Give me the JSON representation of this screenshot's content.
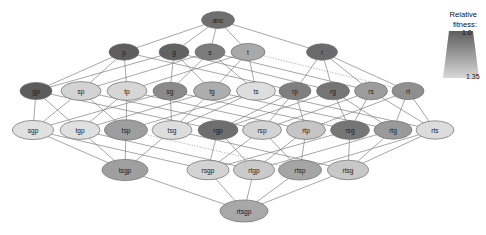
{
  "figure": {
    "type": "network-diagram"
  },
  "legend": {
    "title_line1": "Relative",
    "title_line2": "fitness:",
    "top_tick": "1.0",
    "bottom_tick": "1.35",
    "gradient_top_color": "#5d5d5d",
    "gradient_bottom_color": "#d8d8d8"
  },
  "chart_data": {
    "type": "graph",
    "title": "",
    "levels": [
      1,
      5,
      10,
      10,
      5,
      1
    ],
    "colorscale": {
      "label": "Relative fitness",
      "min": 1.0,
      "max": 1.35,
      "min_color": "#5d5d5d",
      "max_color": "#e2e2e2"
    },
    "nodes": [
      {
        "id": "anc",
        "label": "anc",
        "x": 218,
        "y": 20,
        "rx": 16.5,
        "ry": 8.5,
        "fill": "#6f6f6f",
        "fitness": 1.03
      },
      {
        "id": "p",
        "label": "p",
        "x": 124,
        "y": 52,
        "rx": 15.0,
        "ry": 8.2,
        "fill": "#5e5e5e",
        "fitness": 1.01
      },
      {
        "id": "g",
        "label": "g",
        "x": 174,
        "y": 52,
        "rx": 15.0,
        "ry": 8.2,
        "fill": "#626262",
        "fitness": 1.02
      },
      {
        "id": "s",
        "label": "s",
        "x": 210,
        "y": 52,
        "rx": 15.0,
        "ry": 8.2,
        "fill": "#7c7c7c",
        "fitness": 1.06
      },
      {
        "id": "t",
        "label": "t",
        "x": 248,
        "y": 52,
        "rx": 17.0,
        "ry": 8.5,
        "fill": "#a9a9a9",
        "fitness": 1.13
      },
      {
        "id": "r",
        "label": "r",
        "x": 322,
        "y": 52,
        "rx": 15.5,
        "ry": 8.2,
        "fill": "#6b6b6b",
        "fitness": 1.03
      },
      {
        "id": "gp",
        "label": "gp",
        "x": 36,
        "y": 91,
        "rx": 16.0,
        "ry": 8.6,
        "fill": "#5c5c5c",
        "fitness": 1.0
      },
      {
        "id": "sp",
        "label": "sp",
        "x": 81,
        "y": 91,
        "rx": 20.0,
        "ry": 9.4,
        "fill": "#d3d3d3",
        "fitness": 1.26
      },
      {
        "id": "tp",
        "label": "tp",
        "x": 127,
        "y": 91,
        "rx": 20.0,
        "ry": 9.4,
        "fill": "#d6d6d6",
        "fitness": 1.27
      },
      {
        "id": "sg",
        "label": "sg",
        "x": 170,
        "y": 91,
        "rx": 17.0,
        "ry": 8.8,
        "fill": "#8a8a8a",
        "fitness": 1.09
      },
      {
        "id": "tg",
        "label": "tg",
        "x": 212,
        "y": 91,
        "rx": 18.5,
        "ry": 9.2,
        "fill": "#adadad",
        "fitness": 1.15
      },
      {
        "id": "ts",
        "label": "ts",
        "x": 256,
        "y": 91,
        "rx": 19.5,
        "ry": 9.2,
        "fill": "#dedede",
        "fitness": 1.29
      },
      {
        "id": "rp",
        "label": "rp",
        "x": 295,
        "y": 91,
        "rx": 16.0,
        "ry": 8.6,
        "fill": "#7f7f7f",
        "fitness": 1.07
      },
      {
        "id": "rg",
        "label": "rg",
        "x": 333,
        "y": 91,
        "rx": 16.5,
        "ry": 8.8,
        "fill": "#757575",
        "fitness": 1.05
      },
      {
        "id": "rs",
        "label": "rs",
        "x": 371,
        "y": 91,
        "rx": 16.5,
        "ry": 8.8,
        "fill": "#9c9c9c",
        "fitness": 1.12
      },
      {
        "id": "rt",
        "label": "rt",
        "x": 408,
        "y": 91,
        "rx": 16.0,
        "ry": 8.6,
        "fill": "#8f8f8f",
        "fitness": 1.1
      },
      {
        "id": "sgp",
        "label": "sgp",
        "x": 33,
        "y": 130,
        "rx": 20.5,
        "ry": 9.6,
        "fill": "#e0e0e0",
        "fitness": 1.3
      },
      {
        "id": "tgp",
        "label": "tgp",
        "x": 80,
        "y": 130,
        "rx": 20.0,
        "ry": 9.4,
        "fill": "#e0e0e0",
        "fitness": 1.3
      },
      {
        "id": "tsp",
        "label": "tsp",
        "x": 126,
        "y": 130,
        "rx": 21.5,
        "ry": 10.2,
        "fill": "#9e9e9e",
        "fitness": 1.12
      },
      {
        "id": "tsg",
        "label": "tsg",
        "x": 172,
        "y": 130,
        "rx": 20.0,
        "ry": 9.4,
        "fill": "#dddddd",
        "fitness": 1.29
      },
      {
        "id": "rgp",
        "label": "rgp",
        "x": 218,
        "y": 130,
        "rx": 20.0,
        "ry": 9.6,
        "fill": "#6e6e6e",
        "fitness": 1.04
      },
      {
        "id": "rsp",
        "label": "rsp",
        "x": 262,
        "y": 130,
        "rx": 19.5,
        "ry": 9.4,
        "fill": "#d3d3d3",
        "fitness": 1.26
      },
      {
        "id": "rtp",
        "label": "rtp",
        "x": 306,
        "y": 130,
        "rx": 19.5,
        "ry": 9.4,
        "fill": "#c5c5c5",
        "fitness": 1.23
      },
      {
        "id": "rsg",
        "label": "rsg",
        "x": 350,
        "y": 130,
        "rx": 19.5,
        "ry": 9.4,
        "fill": "#767676",
        "fitness": 1.05
      },
      {
        "id": "rtg",
        "label": "rtg",
        "x": 393,
        "y": 130,
        "rx": 19.0,
        "ry": 9.2,
        "fill": "#9a9a9a",
        "fitness": 1.11
      },
      {
        "id": "rts",
        "label": "rts",
        "x": 435,
        "y": 130,
        "rx": 19.0,
        "ry": 9.2,
        "fill": "#dcdcdc",
        "fitness": 1.29
      },
      {
        "id": "tsgp",
        "label": "tsgp",
        "x": 125,
        "y": 170,
        "rx": 23.0,
        "ry": 10.6,
        "fill": "#9f9f9f",
        "fitness": 1.12
      },
      {
        "id": "rsgp",
        "label": "rsgp",
        "x": 208,
        "y": 170,
        "rx": 21.0,
        "ry": 9.8,
        "fill": "#d3d3d3",
        "fitness": 1.26
      },
      {
        "id": "rtgp",
        "label": "rtgp",
        "x": 254,
        "y": 170,
        "rx": 20.5,
        "ry": 9.8,
        "fill": "#cacaca",
        "fitness": 1.24
      },
      {
        "id": "rtsp",
        "label": "rtsp",
        "x": 300,
        "y": 170,
        "rx": 21.5,
        "ry": 10.0,
        "fill": "#a5a5a5",
        "fitness": 1.13
      },
      {
        "id": "rtsg",
        "label": "rtsg",
        "x": 348,
        "y": 170,
        "rx": 20.5,
        "ry": 9.8,
        "fill": "#c8c8c8",
        "fitness": 1.24
      },
      {
        "id": "rtsgp",
        "label": "rtsgp",
        "x": 244,
        "y": 211,
        "rx": 24.0,
        "ry": 11.0,
        "fill": "#a8a8a8",
        "fitness": 1.14
      }
    ],
    "edges": [
      {
        "from": "anc",
        "to": "p",
        "style": "solid"
      },
      {
        "from": "anc",
        "to": "g",
        "style": "solid"
      },
      {
        "from": "anc",
        "to": "s",
        "style": "solid"
      },
      {
        "from": "anc",
        "to": "t",
        "style": "solid"
      },
      {
        "from": "anc",
        "to": "r",
        "style": "solid"
      },
      {
        "from": "p",
        "to": "gp",
        "style": "solid"
      },
      {
        "from": "p",
        "to": "sp",
        "style": "solid"
      },
      {
        "from": "p",
        "to": "tp",
        "style": "solid"
      },
      {
        "from": "p",
        "to": "rp",
        "style": "solid"
      },
      {
        "from": "g",
        "to": "gp",
        "style": "solid"
      },
      {
        "from": "g",
        "to": "sg",
        "style": "solid"
      },
      {
        "from": "g",
        "to": "tg",
        "style": "solid"
      },
      {
        "from": "g",
        "to": "rg",
        "style": "solid"
      },
      {
        "from": "s",
        "to": "sp",
        "style": "solid"
      },
      {
        "from": "s",
        "to": "sg",
        "style": "solid"
      },
      {
        "from": "s",
        "to": "ts",
        "style": "solid"
      },
      {
        "from": "s",
        "to": "rs",
        "style": "solid"
      },
      {
        "from": "t",
        "to": "tp",
        "style": "solid"
      },
      {
        "from": "t",
        "to": "tg",
        "style": "solid"
      },
      {
        "from": "t",
        "to": "ts",
        "style": "solid"
      },
      {
        "from": "t",
        "to": "rt",
        "style": "dotted"
      },
      {
        "from": "r",
        "to": "rp",
        "style": "solid"
      },
      {
        "from": "r",
        "to": "rg",
        "style": "solid"
      },
      {
        "from": "r",
        "to": "rs",
        "style": "solid"
      },
      {
        "from": "r",
        "to": "rt",
        "style": "solid"
      },
      {
        "from": "gp",
        "to": "sgp",
        "style": "solid"
      },
      {
        "from": "gp",
        "to": "tgp",
        "style": "solid"
      },
      {
        "from": "gp",
        "to": "rgp",
        "style": "solid"
      },
      {
        "from": "sp",
        "to": "sgp",
        "style": "solid"
      },
      {
        "from": "sp",
        "to": "tsp",
        "style": "solid"
      },
      {
        "from": "sp",
        "to": "rsp",
        "style": "solid"
      },
      {
        "from": "tp",
        "to": "tgp",
        "style": "solid"
      },
      {
        "from": "tp",
        "to": "tsp",
        "style": "solid"
      },
      {
        "from": "tp",
        "to": "rtp",
        "style": "solid"
      },
      {
        "from": "sg",
        "to": "sgp",
        "style": "solid"
      },
      {
        "from": "sg",
        "to": "tsg",
        "style": "solid"
      },
      {
        "from": "sg",
        "to": "rsg",
        "style": "solid"
      },
      {
        "from": "tg",
        "to": "tgp",
        "style": "solid"
      },
      {
        "from": "tg",
        "to": "tsg",
        "style": "solid"
      },
      {
        "from": "tg",
        "to": "rtg",
        "style": "solid"
      },
      {
        "from": "ts",
        "to": "tsp",
        "style": "solid"
      },
      {
        "from": "ts",
        "to": "tsg",
        "style": "solid"
      },
      {
        "from": "ts",
        "to": "rts",
        "style": "solid"
      },
      {
        "from": "rp",
        "to": "rgp",
        "style": "solid"
      },
      {
        "from": "rp",
        "to": "rsp",
        "style": "solid"
      },
      {
        "from": "rp",
        "to": "rtp",
        "style": "solid"
      },
      {
        "from": "rg",
        "to": "rgp",
        "style": "solid"
      },
      {
        "from": "rg",
        "to": "rsg",
        "style": "solid"
      },
      {
        "from": "rg",
        "to": "rtg",
        "style": "solid"
      },
      {
        "from": "rs",
        "to": "rsp",
        "style": "solid"
      },
      {
        "from": "rs",
        "to": "rsg",
        "style": "solid"
      },
      {
        "from": "rs",
        "to": "rts",
        "style": "solid"
      },
      {
        "from": "rt",
        "to": "rtp",
        "style": "solid"
      },
      {
        "from": "rt",
        "to": "rtg",
        "style": "solid"
      },
      {
        "from": "rt",
        "to": "rts",
        "style": "solid"
      },
      {
        "from": "sgp",
        "to": "tsgp",
        "style": "solid"
      },
      {
        "from": "sgp",
        "to": "rsgp",
        "style": "solid"
      },
      {
        "from": "tgp",
        "to": "tsgp",
        "style": "solid"
      },
      {
        "from": "tgp",
        "to": "rtgp",
        "style": "solid"
      },
      {
        "from": "tsp",
        "to": "tsgp",
        "style": "solid"
      },
      {
        "from": "tsp",
        "to": "rtsp",
        "style": "dotted"
      },
      {
        "from": "tsg",
        "to": "tsgp",
        "style": "solid"
      },
      {
        "from": "tsg",
        "to": "rtsg",
        "style": "solid"
      },
      {
        "from": "rgp",
        "to": "rsgp",
        "style": "solid"
      },
      {
        "from": "rgp",
        "to": "rtgp",
        "style": "solid"
      },
      {
        "from": "rsp",
        "to": "rsgp",
        "style": "solid"
      },
      {
        "from": "rsp",
        "to": "rtsp",
        "style": "solid"
      },
      {
        "from": "rtp",
        "to": "rtgp",
        "style": "solid"
      },
      {
        "from": "rtp",
        "to": "rtsp",
        "style": "solid"
      },
      {
        "from": "rsg",
        "to": "rsgp",
        "style": "solid"
      },
      {
        "from": "rsg",
        "to": "rtsg",
        "style": "solid"
      },
      {
        "from": "rtg",
        "to": "rtgp",
        "style": "solid"
      },
      {
        "from": "rtg",
        "to": "rtsg",
        "style": "solid"
      },
      {
        "from": "rts",
        "to": "rtsp",
        "style": "solid"
      },
      {
        "from": "rts",
        "to": "rtsg",
        "style": "solid"
      },
      {
        "from": "tsgp",
        "to": "rtsgp",
        "style": "solid"
      },
      {
        "from": "rsgp",
        "to": "rtsgp",
        "style": "solid"
      },
      {
        "from": "rtgp",
        "to": "rtsgp",
        "style": "solid"
      },
      {
        "from": "rtsp",
        "to": "rtsgp",
        "style": "solid"
      },
      {
        "from": "rtsg",
        "to": "rtsgp",
        "style": "solid"
      }
    ]
  }
}
